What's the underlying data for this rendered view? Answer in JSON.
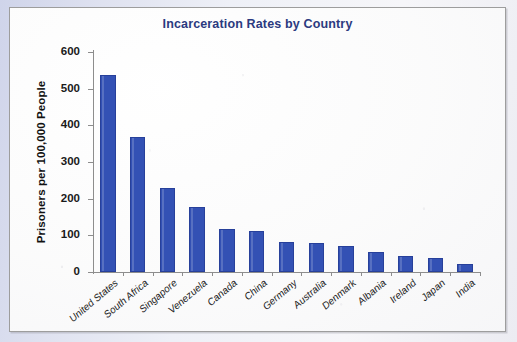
{
  "chart_data": {
    "type": "bar",
    "title": "Incarceration Rates by Country",
    "xlabel": "",
    "ylabel": "Prisoners per 100,000 People",
    "ylim": [
      0,
      600
    ],
    "yticks": [
      0,
      100,
      200,
      300,
      400,
      500,
      600
    ],
    "grid": false,
    "legend": "none",
    "bar_color": "#3351b4",
    "title_color": "#2b3a80",
    "categories": [
      "United States",
      "South Africa",
      "Singapore",
      "Venezuela",
      "Canada",
      "China",
      "Germany",
      "Australia",
      "Denmark",
      "Albania",
      "Ireland",
      "Japan",
      "India"
    ],
    "values": [
      538,
      369,
      229,
      177,
      116,
      111,
      81,
      80,
      70,
      55,
      45,
      37,
      23
    ]
  }
}
